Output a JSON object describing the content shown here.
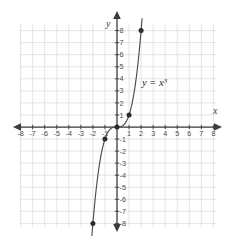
{
  "figure": {
    "kind": "coordinate-plane-graph",
    "background_color": "#ffffff",
    "grid_color": "#e2e2e6",
    "axis_color": "#3c3c3c",
    "curve_color": "#4d4d4d",
    "point_color": "#2b2b2b",
    "label_color": "#4a4a4a"
  },
  "chart_data": {
    "type": "line",
    "title": "",
    "subtitle": "",
    "xlabel": "x",
    "ylabel": "y",
    "equation_label": "y = x",
    "equation_exponent": "3",
    "function": "y = x^3",
    "xlim": [
      -8,
      8
    ],
    "ylim": [
      -8,
      8
    ],
    "grid": true,
    "grid_step": 1,
    "legend": "none",
    "annotations": [
      {
        "text": "y = x³",
        "x": 2.4,
        "y": 2.6
      }
    ],
    "x_tick_labels": [
      "-8",
      "-7",
      "-6",
      "-5",
      "-4",
      "-3",
      "-2",
      "-1",
      "1",
      "2",
      "3",
      "4",
      "5",
      "6",
      "7",
      "8"
    ],
    "x_tick_values": [
      -8,
      -7,
      -6,
      -5,
      -4,
      -3,
      -2,
      -1,
      1,
      2,
      3,
      4,
      5,
      6,
      7,
      8
    ],
    "y_tick_labels": [
      "8",
      "7",
      "6",
      "5",
      "4",
      "3",
      "2",
      "1",
      "-1",
      "-2",
      "-3",
      "-4",
      "-5",
      "-6",
      "-7",
      "-8"
    ],
    "y_tick_values": [
      8,
      7,
      6,
      5,
      4,
      3,
      2,
      1,
      -1,
      -2,
      -3,
      -4,
      -5,
      -6,
      -7,
      -8
    ],
    "marked_points": [
      {
        "label": "(-2, -8)",
        "x": -2,
        "y": -8
      },
      {
        "label": "(-1, -1)",
        "x": -1,
        "y": -1
      },
      {
        "label": "(0, 0)",
        "x": 0,
        "y": 0
      },
      {
        "label": "(1, 1)",
        "x": 1,
        "y": 1
      },
      {
        "label": "(2, 8)",
        "x": 2,
        "y": 8
      }
    ],
    "series": [
      {
        "name": "y = x³",
        "x": [
          -2.08,
          -2.0,
          -1.9,
          -1.8,
          -1.7,
          -1.6,
          -1.5,
          -1.4,
          -1.3,
          -1.2,
          -1.1,
          -1.0,
          -0.9,
          -0.8,
          -0.7,
          -0.6,
          -0.5,
          -0.4,
          -0.3,
          -0.2,
          -0.1,
          0,
          0.1,
          0.2,
          0.3,
          0.4,
          0.5,
          0.6,
          0.7,
          0.8,
          0.9,
          1.0,
          1.1,
          1.2,
          1.3,
          1.4,
          1.5,
          1.6,
          1.7,
          1.8,
          1.9,
          2.0,
          2.08
        ],
        "values": [
          -9.0,
          -8.0,
          -6.859,
          -5.832,
          -4.913,
          -4.096,
          -3.375,
          -2.744,
          -2.197,
          -1.728,
          -1.331,
          -1.0,
          -0.729,
          -0.512,
          -0.343,
          -0.216,
          -0.125,
          -0.064,
          -0.027,
          -0.008,
          -0.001,
          0,
          0.001,
          0.008,
          0.027,
          0.064,
          0.125,
          0.216,
          0.343,
          0.512,
          0.729,
          1.0,
          1.331,
          1.728,
          2.197,
          2.744,
          3.375,
          4.096,
          4.913,
          5.832,
          6.859,
          8.0,
          9.0
        ]
      }
    ]
  }
}
